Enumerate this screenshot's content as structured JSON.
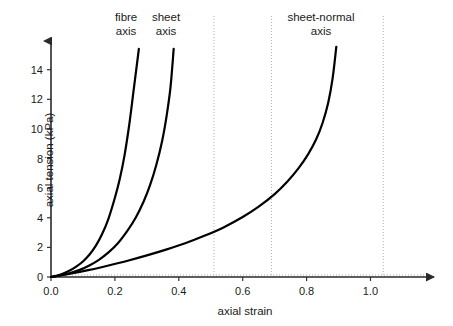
{
  "chart_data": {
    "type": "line",
    "title": "",
    "subtitle": "",
    "xlabel": "axial strain",
    "ylabel": "axial tension (kPa)",
    "xlim": [
      0.0,
      1.18
    ],
    "ylim": [
      0,
      15.6
    ],
    "xticks": [
      "0.0",
      "0.2",
      "0.4",
      "0.6",
      "0.8",
      "1.0"
    ],
    "xtick_values": [
      0.0,
      0.2,
      0.4,
      0.6,
      0.8,
      1.0
    ],
    "yticks": [
      "0",
      "2",
      "4",
      "6",
      "8",
      "10",
      "12",
      "14"
    ],
    "ytick_values": [
      0,
      2,
      4,
      6,
      8,
      10,
      12,
      14
    ],
    "grid": "vertical dotted lines only",
    "gridlines_x": [
      0.51,
      0.69,
      1.04
    ],
    "legend_position": "inline annotations above curves",
    "axis_style": "arrow-headed L axes, no top/right spines",
    "line_color": "#000000",
    "line_width": 2.2,
    "grid_color": "#b0b0b0",
    "axis_color": "#333333",
    "series": [
      {
        "name": "fibre axis",
        "label": "fibre\naxis",
        "label_line1": "fibre",
        "label_line2": "axis",
        "x": [
          0.0,
          0.02,
          0.04,
          0.06,
          0.08,
          0.1,
          0.12,
          0.14,
          0.16,
          0.18,
          0.2,
          0.215,
          0.23,
          0.245,
          0.258,
          0.268,
          0.275
        ],
        "y": [
          0.0,
          0.1,
          0.25,
          0.45,
          0.72,
          1.05,
          1.5,
          2.1,
          2.9,
          3.95,
          5.35,
          6.6,
          8.2,
          10.3,
          12.5,
          14.2,
          15.4
        ]
      },
      {
        "name": "sheet axis",
        "label": "sheet\naxis",
        "label_line1": "sheet",
        "label_line2": "axis",
        "x": [
          0.0,
          0.03,
          0.06,
          0.09,
          0.12,
          0.15,
          0.18,
          0.21,
          0.24,
          0.265,
          0.29,
          0.31,
          0.33,
          0.348,
          0.362,
          0.374,
          0.384
        ],
        "y": [
          0.0,
          0.1,
          0.26,
          0.48,
          0.78,
          1.16,
          1.66,
          2.3,
          3.15,
          4.0,
          5.1,
          6.2,
          7.6,
          9.2,
          10.9,
          12.8,
          15.4
        ]
      },
      {
        "name": "sheet-normal axis",
        "label": "sheet-normal\naxis",
        "label_line1": "sheet-normal",
        "label_line2": "axis",
        "x": [
          0.0,
          0.06,
          0.12,
          0.18,
          0.24,
          0.3,
          0.36,
          0.42,
          0.48,
          0.54,
          0.6,
          0.65,
          0.7,
          0.74,
          0.775,
          0.805,
          0.83,
          0.85,
          0.868,
          0.882,
          0.893
        ],
        "y": [
          0.0,
          0.22,
          0.48,
          0.78,
          1.1,
          1.46,
          1.85,
          2.28,
          2.78,
          3.35,
          4.05,
          4.75,
          5.6,
          6.45,
          7.35,
          8.3,
          9.3,
          10.4,
          11.8,
          13.5,
          15.55
        ]
      }
    ],
    "annotations": [
      {
        "text_line1": "fibre",
        "text_line2": "axis",
        "x": 0.235
      },
      {
        "text_line1": "sheet",
        "text_line2": "axis",
        "x": 0.36
      },
      {
        "text_line1": "sheet-normal",
        "text_line2": "axis",
        "x": 0.845
      }
    ]
  }
}
